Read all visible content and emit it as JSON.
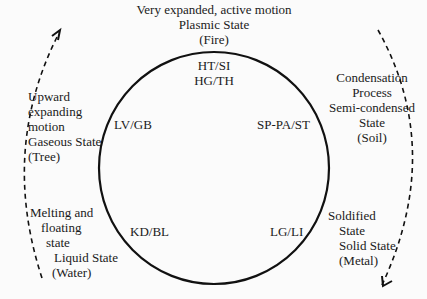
{
  "diagram": {
    "type": "cycle",
    "top": {
      "lines": [
        "Very expanded, active motion",
        "Plasmic State",
        "(Fire)"
      ],
      "inner_lines": [
        "HT/SI",
        "HG/TH"
      ]
    },
    "left_upper": {
      "lines": [
        "Upward",
        "expanding",
        "motion",
        "Gaseous State",
        "(Tree)"
      ],
      "inner": "LV/GB"
    },
    "right_upper": {
      "lines": [
        "Condensation",
        "Process",
        "Semi-condensed",
        "State",
        "(Soil)"
      ],
      "inner": "SP-PA/ST"
    },
    "left_lower": {
      "lines": [
        "Melting and",
        "floating",
        "state",
        "Liquid State",
        "(Water)"
      ],
      "inner": "KD/BL"
    },
    "right_lower": {
      "lines": [
        "Soldified",
        "State",
        "Solid State",
        "(Metal)"
      ],
      "inner": "LG/LI"
    },
    "colors": {
      "stroke": "#111111",
      "background": "#fbfbfb"
    }
  }
}
